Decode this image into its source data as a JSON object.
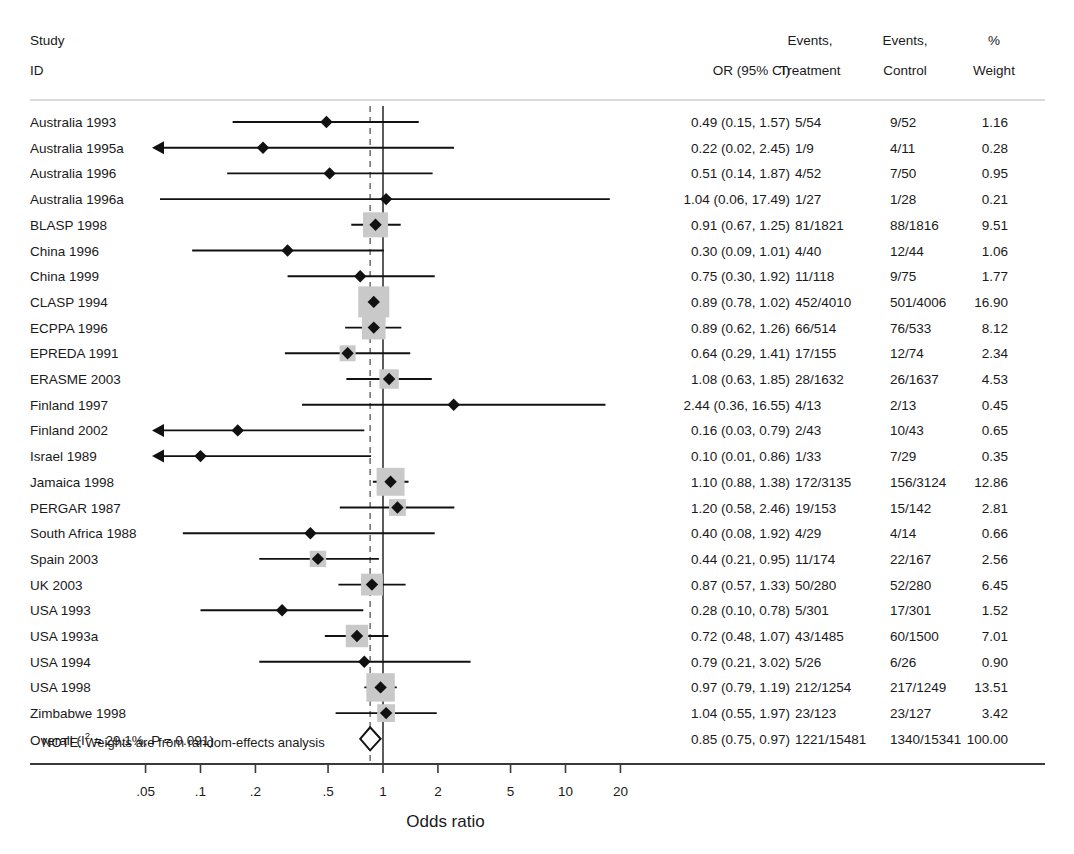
{
  "columns": {
    "study_header_line1": "Study",
    "study_header_line2": "ID",
    "or_header": "OR (95% CI)",
    "events_treatment_line1": "Events,",
    "events_treatment_line2": "Treatment",
    "events_control_line1": "Events,",
    "events_control_line2": "Control",
    "weight_line1": "%",
    "weight_line2": "Weight"
  },
  "note": "NOTE: Weights are from random-effects analysis",
  "overall_label_prefix": "Overall (I",
  "overall_label_suffix": " = 29.1%, P = 0.091)",
  "overall_label_sup": "2",
  "axis_title": "Odds ratio",
  "colors": {
    "marker": "#111111",
    "weight_box": "#c9c9c9",
    "axis": "#3a3a3a",
    "separator": "#b8b8b8",
    "null_line": "#333333",
    "pooled_line": "#555555"
  },
  "chart_data": {
    "type": "forest",
    "title": "",
    "xlabel": "Odds ratio",
    "xscale": "log",
    "xlim": [
      0.035,
      30
    ],
    "xticks": [
      0.05,
      0.1,
      0.2,
      0.5,
      1,
      2,
      5,
      10,
      20
    ],
    "xticklabels": [
      ".05",
      ".1",
      ".2",
      ".5",
      "1",
      "2",
      "5",
      "10",
      "20"
    ],
    "null_value": 1,
    "pooled_value": 0.85,
    "clip_low": 0.058,
    "heterogeneity": {
      "I2_percent": 29.1,
      "p_value": 0.091
    },
    "studies": [
      {
        "id": "Australia 1993",
        "or": 0.49,
        "lo": 0.15,
        "hi": 1.57,
        "or_ci": "0.49 (0.15, 1.57)",
        "events_treatment": "5/54",
        "events_control": "9/52",
        "weight": 1.16
      },
      {
        "id": "Australia 1995a",
        "or": 0.22,
        "lo": 0.02,
        "hi": 2.45,
        "or_ci": "0.22 (0.02, 2.45)",
        "events_treatment": "1/9",
        "events_control": "4/11",
        "weight": 0.28
      },
      {
        "id": "Australia 1996",
        "or": 0.51,
        "lo": 0.14,
        "hi": 1.87,
        "or_ci": "0.51 (0.14, 1.87)",
        "events_treatment": "4/52",
        "events_control": "7/50",
        "weight": 0.95
      },
      {
        "id": "Australia 1996a",
        "or": 1.04,
        "lo": 0.06,
        "hi": 17.49,
        "or_ci": "1.04 (0.06, 17.49)",
        "events_treatment": "1/27",
        "events_control": "1/28",
        "weight": 0.21
      },
      {
        "id": "BLASP 1998",
        "or": 0.91,
        "lo": 0.67,
        "hi": 1.25,
        "or_ci": "0.91 (0.67, 1.25)",
        "events_treatment": "81/1821",
        "events_control": "88/1816",
        "weight": 9.51
      },
      {
        "id": "China 1996",
        "or": 0.3,
        "lo": 0.09,
        "hi": 1.01,
        "or_ci": "0.30 (0.09, 1.01)",
        "events_treatment": "4/40",
        "events_control": "12/44",
        "weight": 1.06
      },
      {
        "id": "China 1999",
        "or": 0.75,
        "lo": 0.3,
        "hi": 1.92,
        "or_ci": "0.75 (0.30, 1.92)",
        "events_treatment": "11/118",
        "events_control": "9/75",
        "weight": 1.77
      },
      {
        "id": "CLASP 1994",
        "or": 0.89,
        "lo": 0.78,
        "hi": 1.02,
        "or_ci": "0.89 (0.78, 1.02)",
        "events_treatment": "452/4010",
        "events_control": "501/4006",
        "weight": 16.9
      },
      {
        "id": "ECPPA 1996",
        "or": 0.89,
        "lo": 0.62,
        "hi": 1.26,
        "or_ci": "0.89 (0.62, 1.26)",
        "events_treatment": "66/514",
        "events_control": "76/533",
        "weight": 8.12
      },
      {
        "id": "EPREDA 1991",
        "or": 0.64,
        "lo": 0.29,
        "hi": 1.41,
        "or_ci": "0.64 (0.29, 1.41)",
        "events_treatment": "17/155",
        "events_control": "12/74",
        "weight": 2.34
      },
      {
        "id": "ERASME 2003",
        "or": 1.08,
        "lo": 0.63,
        "hi": 1.85,
        "or_ci": "1.08 (0.63, 1.85)",
        "events_treatment": "28/1632",
        "events_control": "26/1637",
        "weight": 4.53
      },
      {
        "id": "Finland 1997",
        "or": 2.44,
        "lo": 0.36,
        "hi": 16.55,
        "or_ci": "2.44 (0.36, 16.55)",
        "events_treatment": "4/13",
        "events_control": "2/13",
        "weight": 0.45
      },
      {
        "id": "Finland 2002",
        "or": 0.16,
        "lo": 0.03,
        "hi": 0.79,
        "or_ci": "0.16 (0.03, 0.79)",
        "events_treatment": "2/43",
        "events_control": "10/43",
        "weight": 0.65
      },
      {
        "id": "Israel 1989",
        "or": 0.1,
        "lo": 0.01,
        "hi": 0.86,
        "or_ci": "0.10 (0.01, 0.86)",
        "events_treatment": "1/33",
        "events_control": "7/29",
        "weight": 0.35
      },
      {
        "id": "Jamaica 1998",
        "or": 1.1,
        "lo": 0.88,
        "hi": 1.38,
        "or_ci": "1.10 (0.88, 1.38)",
        "events_treatment": "172/3135",
        "events_control": "156/3124",
        "weight": 12.86
      },
      {
        "id": "PERGAR 1987",
        "or": 1.2,
        "lo": 0.58,
        "hi": 2.46,
        "or_ci": "1.20 (0.58, 2.46)",
        "events_treatment": "19/153",
        "events_control": "15/142",
        "weight": 2.81
      },
      {
        "id": "South Africa 1988",
        "or": 0.4,
        "lo": 0.08,
        "hi": 1.92,
        "or_ci": "0.40 (0.08, 1.92)",
        "events_treatment": "4/29",
        "events_control": "4/14",
        "weight": 0.66
      },
      {
        "id": "Spain 2003",
        "or": 0.44,
        "lo": 0.21,
        "hi": 0.95,
        "or_ci": "0.44 (0.21, 0.95)",
        "events_treatment": "11/174",
        "events_control": "22/167",
        "weight": 2.56
      },
      {
        "id": "UK 2003",
        "or": 0.87,
        "lo": 0.57,
        "hi": 1.33,
        "or_ci": "0.87 (0.57, 1.33)",
        "events_treatment": "50/280",
        "events_control": "52/280",
        "weight": 6.45
      },
      {
        "id": "USA 1993",
        "or": 0.28,
        "lo": 0.1,
        "hi": 0.78,
        "or_ci": "0.28 (0.10, 0.78)",
        "events_treatment": "5/301",
        "events_control": "17/301",
        "weight": 1.52
      },
      {
        "id": "USA 1993a",
        "or": 0.72,
        "lo": 0.48,
        "hi": 1.07,
        "or_ci": "0.72 (0.48, 1.07)",
        "events_treatment": "43/1485",
        "events_control": "60/1500",
        "weight": 7.01
      },
      {
        "id": "USA 1994",
        "or": 0.79,
        "lo": 0.21,
        "hi": 3.02,
        "or_ci": "0.79 (0.21, 3.02)",
        "events_treatment": "5/26",
        "events_control": "6/26",
        "weight": 0.9
      },
      {
        "id": "USA 1998",
        "or": 0.97,
        "lo": 0.79,
        "hi": 1.19,
        "or_ci": "0.97 (0.79, 1.19)",
        "events_treatment": "212/1254",
        "events_control": "217/1249",
        "weight": 13.51
      },
      {
        "id": "Zimbabwe 1998",
        "or": 1.04,
        "lo": 0.55,
        "hi": 1.97,
        "or_ci": "1.04 (0.55, 1.97)",
        "events_treatment": "23/123",
        "events_control": "23/127",
        "weight": 3.42
      }
    ],
    "overall": {
      "id": "Overall (I2 = 29.1%, P = 0.091)",
      "or": 0.85,
      "lo": 0.75,
      "hi": 0.97,
      "or_ci": "0.85 (0.75, 0.97)",
      "events_treatment": "1221/15481",
      "events_control": "1340/15341",
      "weight": "100.00"
    }
  }
}
